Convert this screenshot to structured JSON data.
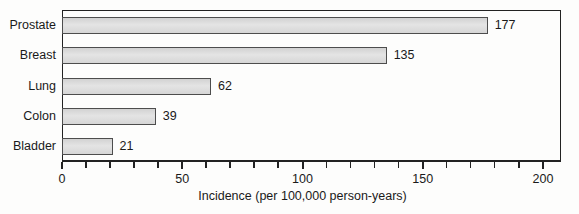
{
  "chart_data": {
    "type": "bar",
    "orientation": "horizontal",
    "categories": [
      "Prostate",
      "Breast",
      "Lung",
      "Colon",
      "Bladder"
    ],
    "values": [
      177,
      135,
      62,
      39,
      21
    ],
    "value_labels": [
      "177",
      "135",
      "62",
      "39",
      "21"
    ],
    "title": "",
    "xlabel": "Incidence (per 100,000 person-years)",
    "ylabel": "",
    "xlim": [
      0,
      207
    ],
    "x_major_ticks": [
      0,
      50,
      100,
      150,
      200
    ],
    "x_major_tick_labels": [
      "0",
      "50",
      "100",
      "150",
      "200"
    ],
    "x_minor_tick_step": 10,
    "grid": "off",
    "legend": "none",
    "colors": {
      "bar_fill": "#d8d8d8",
      "bar_border": "#4d4d4d",
      "axis": "#222222",
      "text": "#1a1a1a",
      "background": "#fdfdfc"
    }
  }
}
